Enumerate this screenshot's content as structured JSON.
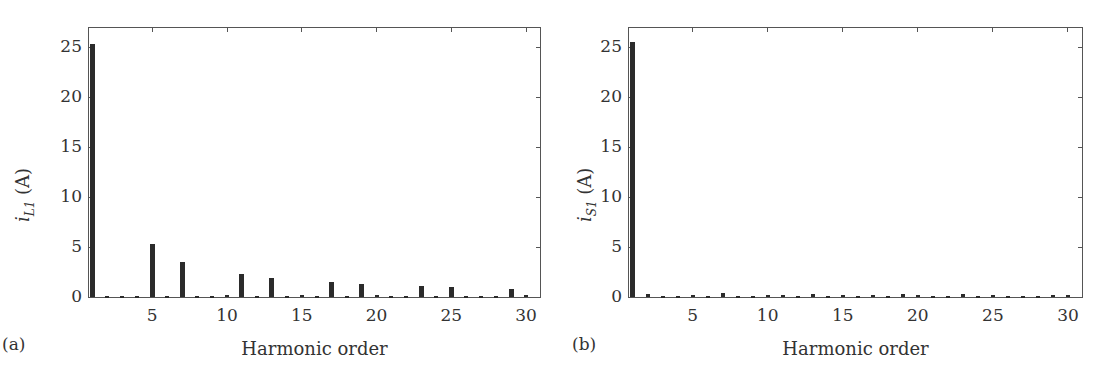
{
  "chart_data": [
    {
      "type": "bar",
      "panel_label": "(a)",
      "title": "",
      "xlabel": "Harmonic order",
      "ylabel_main": "i",
      "ylabel_sub": "L1",
      "ylabel_unit": " (A)",
      "xlim": [
        0.7,
        31
      ],
      "ylim": [
        0,
        27
      ],
      "xticks": [
        5,
        10,
        15,
        20,
        25,
        30
      ],
      "yticks": [
        0,
        5,
        10,
        15,
        20,
        25
      ],
      "grid": false,
      "x": [
        1,
        2,
        3,
        4,
        5,
        6,
        7,
        8,
        9,
        10,
        11,
        12,
        13,
        14,
        15,
        16,
        17,
        18,
        19,
        20,
        21,
        22,
        23,
        24,
        25,
        26,
        27,
        28,
        29,
        30
      ],
      "values": [
        25.3,
        0.1,
        0.1,
        0.1,
        5.3,
        0.1,
        3.5,
        0.1,
        0.1,
        0.2,
        2.3,
        0.1,
        1.9,
        0.1,
        0.2,
        0.1,
        1.5,
        0.1,
        1.3,
        0.2,
        0.1,
        0.1,
        1.1,
        0.1,
        1.0,
        0.1,
        0.1,
        0.1,
        0.85,
        0.2
      ]
    },
    {
      "type": "bar",
      "panel_label": "(b)",
      "title": "",
      "xlabel": "Harmonic order",
      "ylabel_main": "i",
      "ylabel_sub": "S1",
      "ylabel_unit": " (A)",
      "xlim": [
        0.7,
        31
      ],
      "ylim": [
        0,
        27
      ],
      "xticks": [
        5,
        10,
        15,
        20,
        25,
        30
      ],
      "yticks": [
        0,
        5,
        10,
        15,
        20,
        25
      ],
      "grid": false,
      "x": [
        1,
        2,
        3,
        4,
        5,
        6,
        7,
        8,
        9,
        10,
        11,
        12,
        13,
        14,
        15,
        16,
        17,
        18,
        19,
        20,
        21,
        22,
        23,
        24,
        25,
        26,
        27,
        28,
        29,
        30
      ],
      "values": [
        25.5,
        0.35,
        0.1,
        0.1,
        0.2,
        0.1,
        0.45,
        0.1,
        0.1,
        0.2,
        0.2,
        0.1,
        0.35,
        0.1,
        0.2,
        0.1,
        0.2,
        0.1,
        0.3,
        0.2,
        0.1,
        0.1,
        0.35,
        0.1,
        0.25,
        0.1,
        0.1,
        0.1,
        0.2,
        0.25
      ]
    }
  ],
  "colors": {
    "bar": "#2b2b2b",
    "axis": "#555555",
    "text": "#333333"
  }
}
